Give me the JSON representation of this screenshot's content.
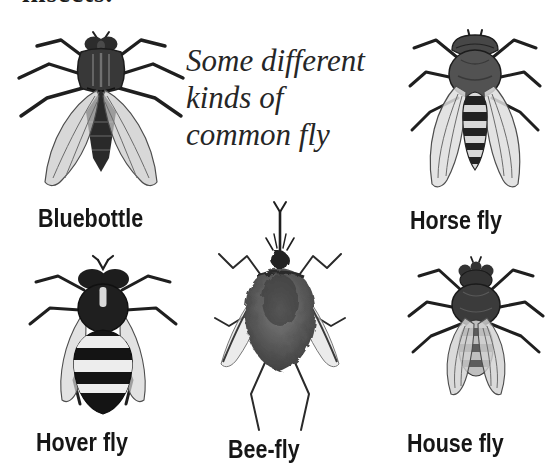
{
  "page": {
    "background_color": "#ffffff",
    "ink_color": "#1f1f1f",
    "wing_color": "#d6d6d6",
    "partial_top_text": "insects.",
    "caption": {
      "line1": "Some different",
      "line2": "kinds of",
      "line3": "common fly"
    },
    "flies": [
      {
        "id": "bluebottle",
        "label": "Bluebottle",
        "position": "top-left"
      },
      {
        "id": "horse-fly",
        "label": "Horse fly",
        "position": "top-right"
      },
      {
        "id": "hover-fly",
        "label": "Hover fly",
        "position": "bottom-left"
      },
      {
        "id": "bee-fly",
        "label": "Bee-fly",
        "position": "bottom-center"
      },
      {
        "id": "house-fly",
        "label": "House fly",
        "position": "bottom-right"
      }
    ]
  }
}
